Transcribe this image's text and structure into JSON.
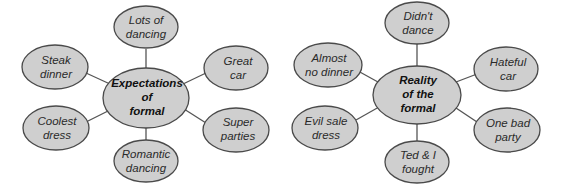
{
  "diagrams": [
    {
      "name": "expectations",
      "center": {
        "lines": [
          "Expectations",
          "of",
          "formal"
        ],
        "x": 146,
        "y": 98,
        "rx": 43,
        "ry": 30
      },
      "nodes": [
        {
          "lines": [
            "Lots of",
            "dancing"
          ],
          "x": 146,
          "y": 27
        },
        {
          "lines": [
            "Steak",
            "dinner"
          ],
          "x": 55,
          "y": 67
        },
        {
          "lines": [
            "Great",
            "car"
          ],
          "x": 236,
          "y": 68
        },
        {
          "lines": [
            "Coolest",
            "dress"
          ],
          "x": 56,
          "y": 128
        },
        {
          "lines": [
            "Super",
            "parties"
          ],
          "x": 236,
          "y": 130
        },
        {
          "lines": [
            "Romantic",
            "dancing"
          ],
          "x": 146,
          "y": 161
        }
      ]
    },
    {
      "name": "reality",
      "center": {
        "lines": [
          "Reality",
          "of the",
          "formal"
        ],
        "x": 417,
        "y": 95,
        "rx": 44,
        "ry": 29
      },
      "nodes": [
        {
          "lines": [
            "Didn't",
            "dance"
          ],
          "x": 417,
          "y": 23
        },
        {
          "lines": [
            "Almost",
            "no dinner"
          ],
          "x": 328,
          "y": 65
        },
        {
          "lines": [
            "Hateful",
            "car"
          ],
          "x": 506,
          "y": 69
        },
        {
          "lines": [
            "Evil sale",
            "dress"
          ],
          "x": 325,
          "y": 128
        },
        {
          "lines": [
            "One bad",
            "party"
          ],
          "x": 507,
          "y": 130
        },
        {
          "lines": [
            "Ted & I",
            "fought"
          ],
          "x": 417,
          "y": 162
        }
      ]
    }
  ],
  "node_size": {
    "rx": 33,
    "ry": 22
  }
}
